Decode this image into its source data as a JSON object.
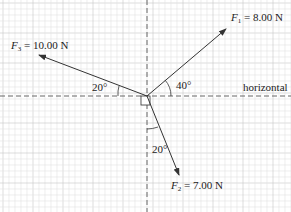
{
  "diagram": {
    "type": "force-diagram",
    "forces": [
      {
        "name": "F",
        "sub": "1",
        "value": "= 8.00 N",
        "angle_label": "40°",
        "reference": "horizontal"
      },
      {
        "name": "F",
        "sub": "2",
        "value": "= 7.00 N",
        "angle_label": "20°",
        "reference": "vertical"
      },
      {
        "name": "F",
        "sub": "3",
        "value": "= 10.00 N",
        "angle_label": "20°",
        "reference": "horizontal"
      }
    ],
    "horizontal_label": "horizontal",
    "colors": {
      "grid_minor": "#e2e2e2",
      "grid_major": "#c8c8c8",
      "line": "#333333"
    }
  }
}
